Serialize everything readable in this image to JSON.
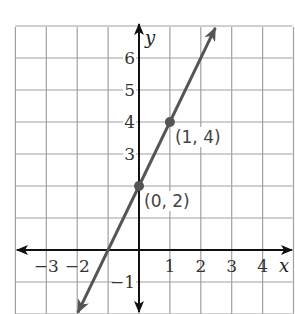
{
  "chart_data": {
    "type": "line",
    "title": "",
    "xlabel": "x",
    "ylabel": "y",
    "xlim": [
      -4,
      5
    ],
    "ylim": [
      -2,
      7
    ],
    "grid": true,
    "x_ticks": [
      {
        "value": -3,
        "label": "−3"
      },
      {
        "value": -2,
        "label": "−2"
      },
      {
        "value": 1,
        "label": "1"
      },
      {
        "value": 2,
        "label": "2"
      },
      {
        "value": 3,
        "label": "3"
      },
      {
        "value": 4,
        "label": "4"
      }
    ],
    "y_ticks": [
      {
        "value": 6,
        "label": "6"
      },
      {
        "value": 5,
        "label": "5"
      },
      {
        "value": 4,
        "label": "4"
      },
      {
        "value": 3,
        "label": "3"
      },
      {
        "value": -1,
        "label": "−1"
      }
    ],
    "series": [
      {
        "name": "y = 2x + 2",
        "slope": 2,
        "intercept": 2,
        "x_range": [
          -2,
          2.5
        ],
        "color": "#555555",
        "arrows": "both"
      }
    ],
    "points": [
      {
        "x": 0,
        "y": 2,
        "label": "(0, 2)"
      },
      {
        "x": 1,
        "y": 4,
        "label": "(1, 4)"
      }
    ]
  },
  "colors": {
    "grid": "#a0a0a0",
    "axes": "#111111",
    "line": "#555555",
    "point": "#555555"
  }
}
